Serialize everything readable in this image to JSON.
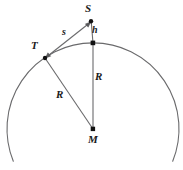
{
  "figure": {
    "type": "geometry-diagram",
    "canvas": {
      "width": 183,
      "height": 170,
      "background": "#ffffff"
    },
    "stroke_color": "#58585a",
    "point_color": "#111111",
    "text_color": "#1a1a1a",
    "circle": {
      "cx": 93,
      "cy": 129,
      "r": 86,
      "arc_start_deg": 202,
      "arc_end_deg": 338
    },
    "points": [
      {
        "id": "S",
        "label": "S",
        "x": 91,
        "y": 21,
        "label_x": 88,
        "label_y": 4,
        "marker": "dot"
      },
      {
        "id": "P",
        "label": "",
        "x": 93,
        "y": 43,
        "label_x": 0,
        "label_y": 0,
        "marker": "square"
      },
      {
        "id": "T",
        "label": "T",
        "x": 45,
        "y": 58,
        "label_x": 32,
        "label_y": 41,
        "marker": "dot"
      },
      {
        "id": "M",
        "label": "M",
        "x": 93,
        "y": 129,
        "label_x": 89,
        "label_y": 134,
        "marker": "square"
      }
    ],
    "segments": [
      {
        "id": "s",
        "label": "s",
        "from": "T",
        "to": "S",
        "label_x": 63,
        "label_y": 27,
        "arrow": "both"
      },
      {
        "id": "h",
        "label": "h",
        "from": "P",
        "to": "S",
        "label_x": 93,
        "label_y": 25,
        "arrow": "none"
      },
      {
        "id": "R1",
        "label": "R",
        "from": "P",
        "to": "M",
        "label_x": 96,
        "label_y": 72,
        "arrow": "none"
      },
      {
        "id": "R2",
        "label": "R",
        "from": "T",
        "to": "M",
        "label_x": 57,
        "label_y": 89,
        "arrow": "none"
      }
    ],
    "labels": {
      "S": "S",
      "T": "T",
      "M": "M",
      "s": "s",
      "h": "h",
      "R_vertical": "R",
      "R_diagonal": "R"
    }
  }
}
